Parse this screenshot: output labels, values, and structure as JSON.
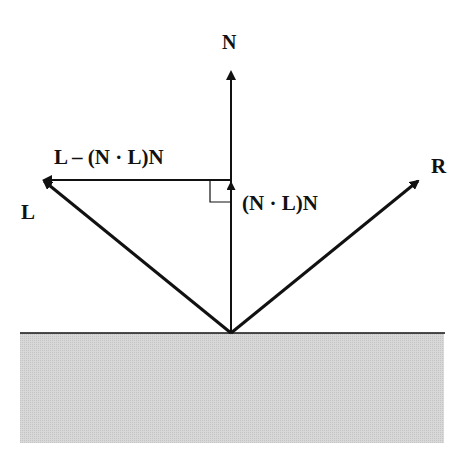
{
  "diagram": {
    "colors": {
      "ink": "#111111",
      "surface_fill": "#d4d4d4",
      "background": "#ffffff"
    },
    "labels": {
      "normal": "N",
      "light": "L",
      "reflected": "R",
      "perpendicular": "L – (N · L)N",
      "projection": "(N · L)N"
    },
    "vectors": [
      {
        "name": "N",
        "from": [
          231,
          333
        ],
        "to": [
          231,
          70
        ]
      },
      {
        "name": "L",
        "from": [
          231,
          333
        ],
        "to": [
          42,
          180
        ]
      },
      {
        "name": "R",
        "from": [
          231,
          333
        ],
        "to": [
          420,
          180
        ]
      },
      {
        "name": "L - (N.L)N",
        "from": [
          231,
          180
        ],
        "to": [
          42,
          180
        ]
      },
      {
        "name": "(N.L)N",
        "from": [
          231,
          333
        ],
        "to": [
          231,
          182
        ]
      }
    ],
    "surface": {
      "x1": 20,
      "x2": 445,
      "y": 333,
      "bottom": 443
    }
  }
}
